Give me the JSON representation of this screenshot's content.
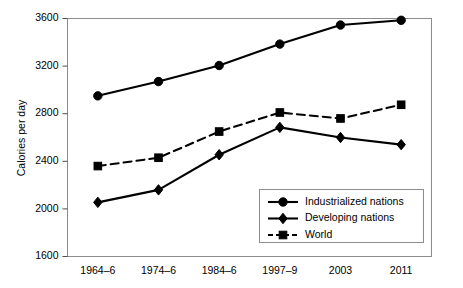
{
  "chart_data": {
    "type": "line",
    "title": "",
    "xlabel": "",
    "ylabel": "Calories per day",
    "categories": [
      "1964–6",
      "1974–6",
      "1984–6",
      "1997–9",
      "2003",
      "2011"
    ],
    "ylim": [
      1600,
      3600
    ],
    "ytick_labels": [
      "1600",
      "2000",
      "2400",
      "2800",
      "3200",
      "3600"
    ],
    "ytick_values": [
      1600,
      2000,
      2400,
      2800,
      3200,
      3600
    ],
    "grid": false,
    "legend_position": "inside-bottom-right",
    "series": [
      {
        "name": "Industrialized nations",
        "marker": "circle",
        "line_style": "solid",
        "color": "#000000",
        "values": [
          2950,
          3070,
          3205,
          3385,
          3545,
          3585
        ]
      },
      {
        "name": "Developing nations",
        "marker": "diamond",
        "line_style": "solid",
        "color": "#000000",
        "values": [
          2055,
          2160,
          2455,
          2685,
          2600,
          2540
        ]
      },
      {
        "name": "World",
        "marker": "square",
        "line_style": "dashed",
        "color": "#000000",
        "values": [
          2360,
          2430,
          2650,
          2810,
          2760,
          2875
        ]
      }
    ]
  },
  "axes": {
    "y_title": "Calories per day"
  },
  "legend": {
    "entries": [
      {
        "label": "Industrialized nations",
        "marker": "circle-marker",
        "dashed": false
      },
      {
        "label": "Developing nations",
        "marker": "diamond-marker",
        "dashed": false
      },
      {
        "label": "World",
        "marker": "square-marker",
        "dashed": true
      }
    ]
  }
}
